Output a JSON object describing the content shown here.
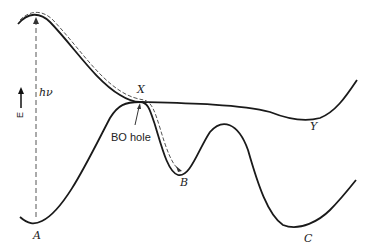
{
  "diagram": {
    "type": "potential-energy-surface",
    "axis_label": "E",
    "excitation_label": "hν",
    "hole_label": "BO hole",
    "points": {
      "A": "A",
      "B": "B",
      "C": "C",
      "X": "X",
      "Y": "Y"
    },
    "colors": {
      "curve": "#1a1a1a",
      "dashed": "#555555",
      "text": "#222222"
    }
  }
}
